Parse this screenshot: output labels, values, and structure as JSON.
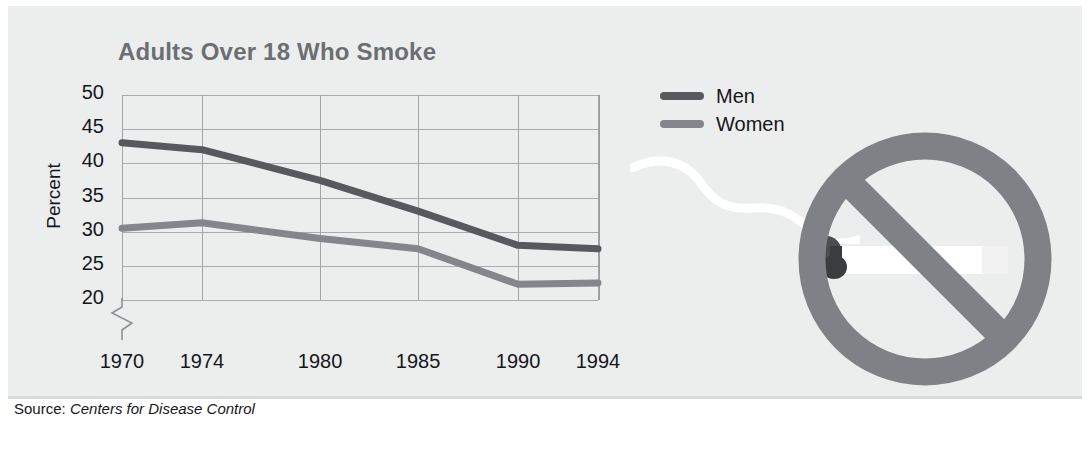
{
  "figure": {
    "source_prefix": "Source:",
    "source_name": "Centers for Disease Control",
    "colors": {
      "card_background": "#eceded",
      "men_line": "#57595c",
      "women_line": "#83868a",
      "title_text": "#6c6f72",
      "grid": "#a9acae",
      "axis": "#8e9194",
      "sign": "#7e8185",
      "cigarette_body": "#ffffff",
      "cigarette_tip": "#3a3c3e"
    },
    "decoration": {
      "no_smoking_icon": "no-smoking-sign",
      "smoke_wisp": "smoke-wisp"
    }
  },
  "chart_data": {
    "type": "line",
    "title": "Adults Over 18 Who Smoke",
    "xlabel": "",
    "ylabel": "Percent",
    "categories": [
      "1970",
      "1974",
      "1980",
      "1985",
      "1990",
      "1994"
    ],
    "x_positions_pct": [
      0,
      16.8,
      41.6,
      62.2,
      83.2,
      100
    ],
    "series": [
      {
        "name": "Men",
        "color": "#57595c",
        "values": [
          43,
          42,
          37.5,
          33,
          28,
          27.5
        ]
      },
      {
        "name": "Women",
        "color": "#83868a",
        "values": [
          30.5,
          31.3,
          29,
          27.5,
          22.3,
          22.5
        ]
      }
    ],
    "ylim": [
      20,
      50
    ],
    "ytick_values": [
      50,
      45,
      40,
      35,
      30,
      25,
      20
    ],
    "ytick_labels": [
      "50",
      "45",
      "40",
      "35",
      "30",
      "25",
      "20"
    ],
    "grid": true,
    "axis_break_below": 20,
    "legend_position": "top-right",
    "legend": [
      "Men",
      "Women"
    ]
  }
}
